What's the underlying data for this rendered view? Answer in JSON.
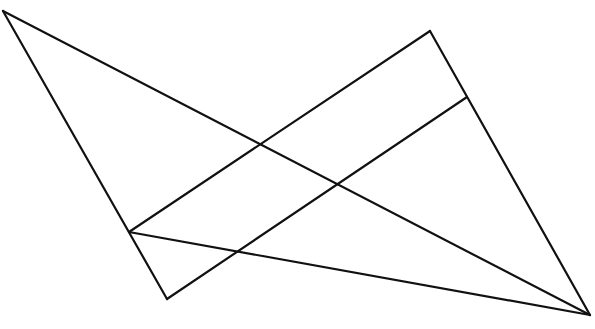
{
  "figure": {
    "background_color": "#ffffff",
    "stroke_color": "#111111",
    "stroke_width": 2.2,
    "canvas": {
      "width": 595,
      "height": 329
    },
    "points": {
      "A": {
        "name": "top-left-vertex",
        "x": 3,
        "y": 11
      },
      "B": {
        "name": "top-apex-vertex",
        "x": 430,
        "y": 31
      },
      "C": {
        "name": "right-junction",
        "x": 467,
        "y": 97
      },
      "D": {
        "name": "bottom-right-vertex",
        "x": 590,
        "y": 315
      },
      "E": {
        "name": "left-junction",
        "x": 129,
        "y": 232
      },
      "F": {
        "name": "bottom-left-vertex",
        "x": 167,
        "y": 299
      }
    },
    "intersections": [
      {
        "name": "upper-crossing",
        "x": 360,
        "y": 75
      },
      {
        "name": "lower-crossing",
        "x": 237,
        "y": 252
      }
    ],
    "segments": [
      {
        "name": "top-edge",
        "from": "A",
        "to": "D",
        "x1": 3,
        "y1": 11,
        "x2": 590,
        "y2": 315
      },
      {
        "name": "left-edge",
        "from": "A",
        "to": "F",
        "x1": 3,
        "y1": 11,
        "x2": 167,
        "y2": 299
      },
      {
        "name": "bottom-edge",
        "from": "E",
        "to": "D",
        "x1": 129,
        "y1": 232,
        "x2": 590,
        "y2": 315
      },
      {
        "name": "upper-diagonal",
        "from": "E",
        "to": "B",
        "x1": 129,
        "y1": 232,
        "x2": 430,
        "y2": 31
      },
      {
        "name": "lower-diagonal",
        "from": "F",
        "to": "C",
        "x1": 167,
        "y1": 299,
        "x2": 467,
        "y2": 97
      },
      {
        "name": "right-edge",
        "from": "B",
        "to": "D",
        "x1": 430,
        "y1": 31,
        "x2": 590,
        "y2": 315
      }
    ]
  }
}
